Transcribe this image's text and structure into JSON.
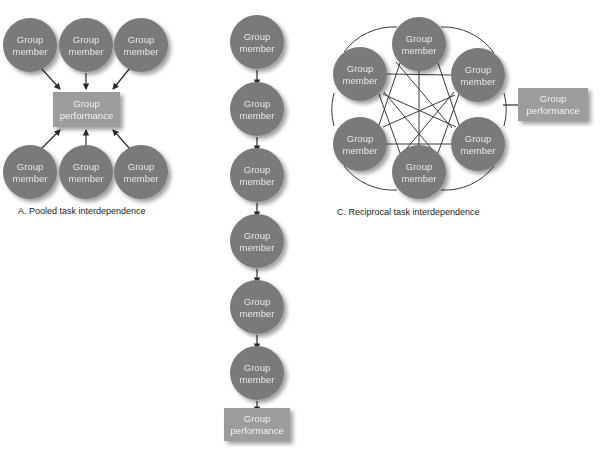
{
  "figure": {
    "node_label_line1": "Group",
    "node_label_line2": "member",
    "box_label_line1": "Group",
    "box_label_line2": "performance",
    "colors": {
      "node_fill": "#7a7a7a",
      "box_fill": "#9c9c9c",
      "node_text": "#e8e8e8",
      "box_text": "#f2f2f2",
      "line": "#3a3a3a",
      "shadow": "#c8c8c8",
      "background": "#ffffff"
    }
  },
  "panels": [
    {
      "id": "panel-a",
      "caption": "A. Pooled task interdependence",
      "caption_x": 18,
      "caption_y": 214,
      "pattern": "pooled",
      "member_count": 6,
      "members": [
        {
          "name": "member-a-top-left",
          "label1": "Group",
          "label2": "member",
          "cx": 30,
          "cy": 45,
          "r": 27
        },
        {
          "name": "member-a-top-center",
          "label1": "Group",
          "label2": "member",
          "cx": 86,
          "cy": 45,
          "r": 27
        },
        {
          "name": "member-a-top-right",
          "label1": "Group",
          "label2": "member",
          "cx": 141,
          "cy": 45,
          "r": 27
        },
        {
          "name": "member-a-bottom-left",
          "label1": "Group",
          "label2": "member",
          "cx": 30,
          "cy": 172,
          "r": 27
        },
        {
          "name": "member-a-bottom-center",
          "label1": "Group",
          "label2": "member",
          "cx": 86,
          "cy": 172,
          "r": 27
        },
        {
          "name": "member-a-bottom-right",
          "label1": "Group",
          "label2": "member",
          "cx": 141,
          "cy": 172,
          "r": 27
        }
      ],
      "outcome_box": {
        "name": "performance-box-a",
        "label1": "Group",
        "label2": "performance",
        "x": 53,
        "y": 92,
        "w": 67,
        "h": 35
      }
    },
    {
      "id": "panel-b",
      "caption": "",
      "pattern": "sequential",
      "member_count": 6,
      "members": [
        {
          "name": "member-b-1",
          "label1": "Group",
          "label2": "member",
          "cx": 257,
          "cy": 42,
          "r": 27
        },
        {
          "name": "member-b-2",
          "label1": "Group",
          "label2": "member",
          "cx": 257,
          "cy": 109,
          "r": 27
        },
        {
          "name": "member-b-3",
          "label1": "Group",
          "label2": "member",
          "cx": 257,
          "cy": 175,
          "r": 27
        },
        {
          "name": "member-b-4",
          "label1": "Group",
          "label2": "member",
          "cx": 257,
          "cy": 241,
          "r": 27
        },
        {
          "name": "member-b-5",
          "label1": "Group",
          "label2": "member",
          "cx": 257,
          "cy": 307,
          "r": 27
        },
        {
          "name": "member-b-6",
          "label1": "Group",
          "label2": "member",
          "cx": 257,
          "cy": 373,
          "r": 27
        }
      ],
      "outcome_box": {
        "name": "performance-box-b",
        "label1": "Group",
        "label2": "performance",
        "x": 224,
        "y": 408,
        "w": 66,
        "h": 33
      }
    },
    {
      "id": "panel-c",
      "caption": "C. Reciprocal task interdependence",
      "caption_x": 337,
      "caption_y": 215,
      "pattern": "reciprocal",
      "member_count": 6,
      "members": [
        {
          "name": "member-c-top",
          "label1": "Group",
          "label2": "member",
          "cx": 419,
          "cy": 44,
          "r": 27
        },
        {
          "name": "member-c-upper-left",
          "label1": "Group",
          "label2": "member",
          "cx": 360,
          "cy": 74,
          "r": 27
        },
        {
          "name": "member-c-upper-right",
          "label1": "Group",
          "label2": "member",
          "cx": 478,
          "cy": 75,
          "r": 27
        },
        {
          "name": "member-c-lower-left",
          "label1": "Group",
          "label2": "member",
          "cx": 360,
          "cy": 144,
          "r": 27
        },
        {
          "name": "member-c-lower-right",
          "label1": "Group",
          "label2": "member",
          "cx": 478,
          "cy": 144,
          "r": 27
        },
        {
          "name": "member-c-bottom",
          "label1": "Group",
          "label2": "member",
          "cx": 419,
          "cy": 172,
          "r": 27
        }
      ],
      "outcome_box": {
        "name": "performance-box-c",
        "label1": "Group",
        "label2": "performance",
        "x": 518,
        "y": 88,
        "w": 70,
        "h": 33
      }
    }
  ]
}
